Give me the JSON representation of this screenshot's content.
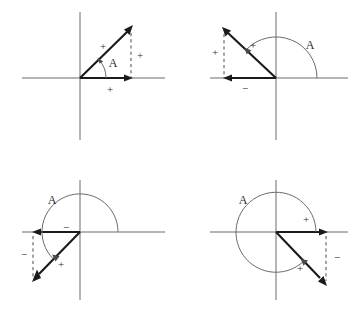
{
  "figure": {
    "width": 357,
    "height": 317,
    "background_color": "#ffffff",
    "axis_color": "#6b6b6b",
    "vector_color": "#1a1a1a",
    "dashed_color": "#4a4a4a",
    "text_color": "#2b2b2b"
  },
  "panels": [
    {
      "id": "quadrant-1",
      "position": "top-left",
      "quadrant": 1,
      "angle_label": "A",
      "angle_label_x": 113,
      "angle_label_y": 67,
      "origin": {
        "x": 80,
        "y": 78
      },
      "x_axis": {
        "x1": 22,
        "y1": 78,
        "x2": 165,
        "y2": 78
      },
      "y_axis": {
        "x1": 80,
        "y1": 12,
        "x2": 80,
        "y2": 140
      },
      "vector_tip": {
        "x": 131,
        "y": 28
      },
      "component_x_tip": {
        "x": 131,
        "y": 78
      },
      "dashed": {
        "x1": 131,
        "y1": 32,
        "x2": 131,
        "y2": 78
      },
      "arc": {
        "radius": 26,
        "start_deg": 0,
        "end_deg": 44
      },
      "signs": [
        {
          "label": "+",
          "role": "vector-resultant-sign",
          "x": 103,
          "y": 50
        },
        {
          "label": "+",
          "role": "y-component-sign",
          "x": 140,
          "y": 59
        },
        {
          "label": "+",
          "role": "x-component-sign",
          "x": 110,
          "y": 93
        }
      ]
    },
    {
      "id": "quadrant-2",
      "position": "top-right",
      "quadrant": 2,
      "angle_label": "A",
      "angle_label_x": 310,
      "angle_label_y": 49,
      "origin": {
        "x": 276,
        "y": 78
      },
      "x_axis": {
        "x1": 210,
        "y1": 78,
        "x2": 348,
        "y2": 78
      },
      "y_axis": {
        "x1": 276,
        "y1": 12,
        "x2": 276,
        "y2": 140
      },
      "vector_tip": {
        "x": 224,
        "y": 29
      },
      "component_x_tip": {
        "x": 224,
        "y": 78
      },
      "dashed": {
        "x1": 224,
        "y1": 33,
        "x2": 224,
        "y2": 78
      },
      "arc": {
        "radius": 41,
        "start_deg": 0,
        "end_deg": 136
      },
      "signs": [
        {
          "label": "+",
          "role": "vector-resultant-sign",
          "x": 253,
          "y": 49
        },
        {
          "label": "+",
          "role": "y-component-sign",
          "x": 215,
          "y": 56
        },
        {
          "label": "−",
          "role": "x-component-sign",
          "x": 245,
          "y": 92
        }
      ]
    },
    {
      "id": "quadrant-3",
      "position": "bottom-left",
      "quadrant": 3,
      "angle_label": "A",
      "angle_label_x": 52,
      "angle_label_y": 204,
      "origin": {
        "x": 80,
        "y": 232
      },
      "x_axis": {
        "x1": 22,
        "y1": 232,
        "x2": 165,
        "y2": 232
      },
      "y_axis": {
        "x1": 80,
        "y1": 180,
        "x2": 80,
        "y2": 300
      },
      "vector_tip": {
        "x": 33,
        "y": 281
      },
      "component_x_tip": {
        "x": 33,
        "y": 232
      },
      "dashed": {
        "x1": 33,
        "y1": 236,
        "x2": 33,
        "y2": 277
      },
      "arc": {
        "radius": 38,
        "start_deg": 0,
        "end_deg": 226
      },
      "signs": [
        {
          "label": "−",
          "role": "x-component-sign",
          "x": 66,
          "y": 231
        },
        {
          "label": "−",
          "role": "y-component-sign",
          "x": 24,
          "y": 258
        },
        {
          "label": "+",
          "role": "vector-resultant-sign",
          "x": 61,
          "y": 268
        }
      ]
    },
    {
      "id": "quadrant-4",
      "position": "bottom-right",
      "quadrant": 4,
      "angle_label": "A",
      "angle_label_x": 243,
      "angle_label_y": 204,
      "origin": {
        "x": 276,
        "y": 232
      },
      "x_axis": {
        "x1": 210,
        "y1": 232,
        "x2": 348,
        "y2": 232
      },
      "y_axis": {
        "x1": 276,
        "y1": 180,
        "x2": 276,
        "y2": 300
      },
      "vector_tip": {
        "x": 326,
        "y": 284
      },
      "component_x_tip": {
        "x": 326,
        "y": 232
      },
      "dashed": {
        "x1": 326,
        "y1": 236,
        "x2": 326,
        "y2": 280
      },
      "arc": {
        "radius": 40,
        "start_deg": 0,
        "end_deg": 313
      },
      "signs": [
        {
          "label": "+",
          "role": "x-component-sign",
          "x": 306,
          "y": 223
        },
        {
          "label": "+",
          "role": "vector-resultant-sign",
          "x": 300,
          "y": 272
        },
        {
          "label": "−",
          "role": "y-component-sign",
          "x": 337,
          "y": 261
        }
      ]
    }
  ]
}
